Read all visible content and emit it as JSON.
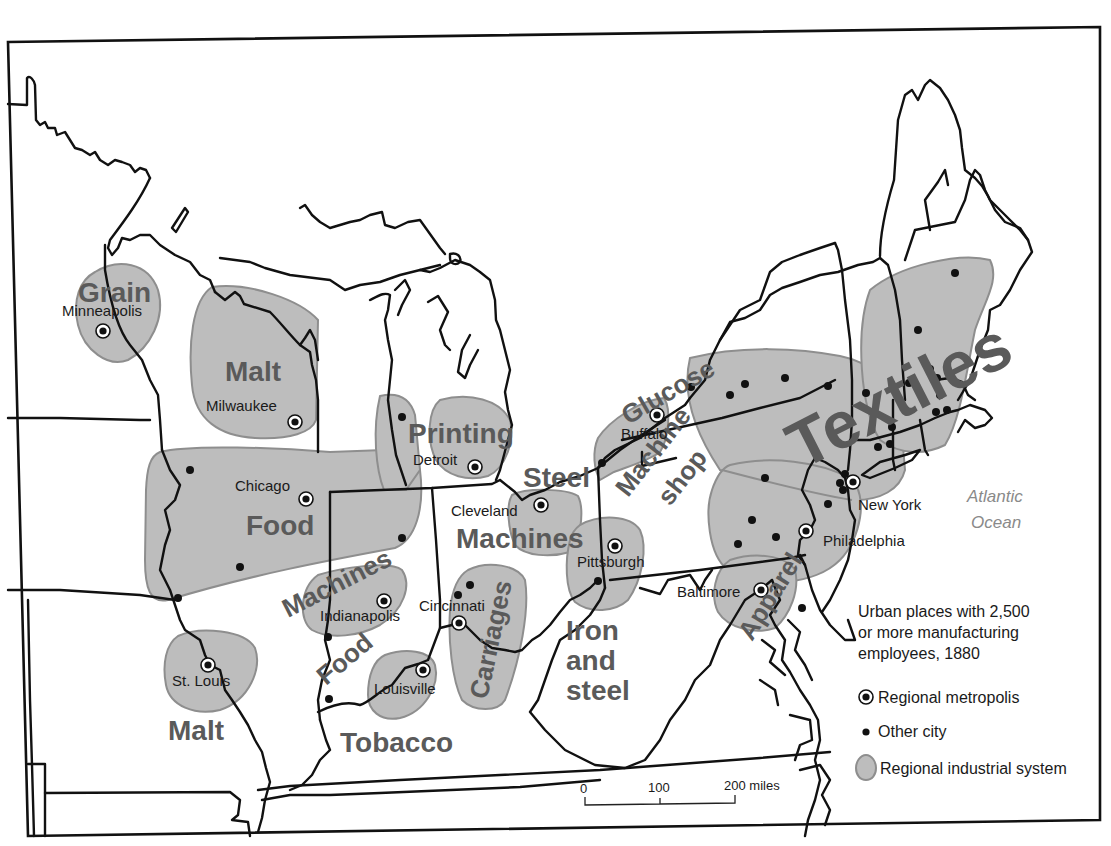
{
  "map": {
    "title_note": "Urban places with 2,500 or more manufacturing employees, 1880",
    "colors": {
      "region_fill": "#bdbdbd",
      "region_stroke": "#8e8e8e",
      "industry_label": "#5a5a5a",
      "ocean_label": "#8a8a8a",
      "border": "#111111"
    },
    "ocean": {
      "line1": "Atlantic",
      "line2": "Ocean"
    },
    "industry_labels": {
      "grain": "Grain",
      "malt_wi": "Malt",
      "printing": "Printing",
      "food_il": "Food",
      "steel_oh": "Steel",
      "machines_oh": "Machines",
      "machines_in": "Machines",
      "food_in": "Food",
      "carriages": "Carriages",
      "malt_mo": "Malt",
      "tobacco": "Tobacco",
      "iron_line1": "Iron",
      "iron_line2": "and",
      "iron_line3": "steel",
      "glucose": "Glucose",
      "machine_shop_line1": "Machine",
      "machine_shop_line2": "shop",
      "textiles": "Textiles",
      "apparel": "Apparel"
    },
    "cities": {
      "minneapolis": "Minneapolis",
      "milwaukee": "Milwaukee",
      "chicago": "Chicago",
      "detroit": "Detroit",
      "cleveland": "Cleveland",
      "pittsburgh": "Pittsburgh",
      "buffalo": "Buffalo",
      "new_york": "New York",
      "philadelphia": "Philadelphia",
      "baltimore": "Baltimore",
      "indianapolis": "Indianapolis",
      "cincinnati": "Cincinnati",
      "louisville": "Louisville",
      "st_louis": "St. Louis"
    },
    "legend": {
      "heading_line1": "Urban places with 2,500",
      "heading_line2": "or more manufacturing",
      "heading_line3": "employees, 1880",
      "metropolis": "Regional metropolis",
      "other_city": "Other city",
      "industrial_system": "Regional industrial system"
    },
    "scale_bar": {
      "tick0": "0",
      "tick1": "100",
      "tick2": "200 miles"
    }
  }
}
